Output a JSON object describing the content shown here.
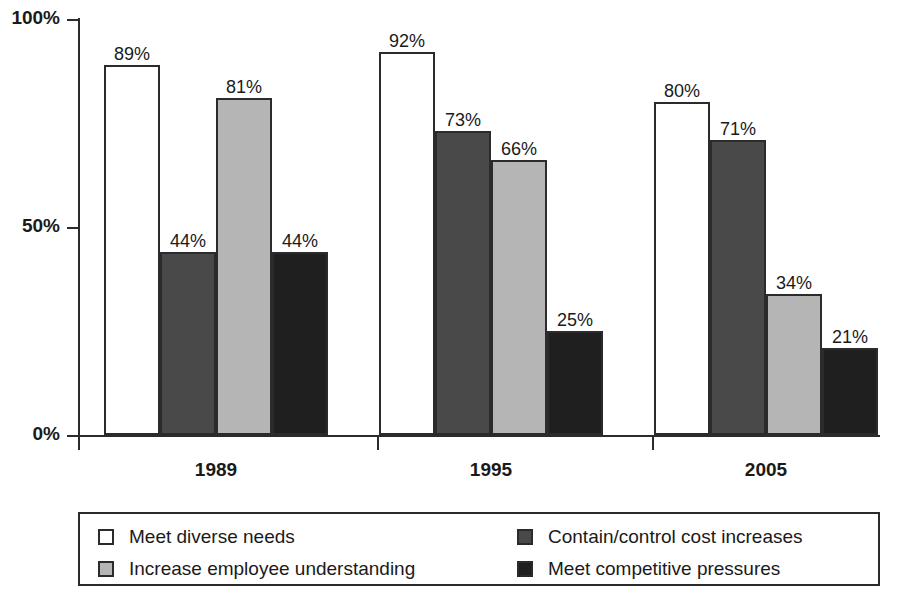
{
  "chart_data": {
    "type": "bar",
    "title": "",
    "subtitle": "",
    "xlabel": "",
    "ylabel": "",
    "categories": [
      "1989",
      "1995",
      "2005"
    ],
    "series": [
      {
        "name": "Meet diverse needs",
        "color": "#ffffff",
        "values": [
          89,
          92,
          80
        ],
        "labels": [
          "89%",
          "92%",
          "80%"
        ]
      },
      {
        "name": "Contain/control cost increases",
        "color": "#494949",
        "values": [
          44,
          73,
          71
        ],
        "labels": [
          "44%",
          "73%",
          "71%"
        ]
      },
      {
        "name": "Increase employee understanding",
        "color": "#b5b5b5",
        "values": [
          81,
          66,
          34
        ],
        "labels": [
          "81%",
          "66%",
          "34%"
        ]
      },
      {
        "name": "Meet competitive pressures",
        "color": "#1f1f1f",
        "values": [
          44,
          25,
          21
        ],
        "labels": [
          "44%",
          "25%",
          "21%"
        ]
      }
    ],
    "ylim": [
      0,
      100
    ],
    "yticks": [
      0,
      50,
      100
    ],
    "ytick_labels": [
      "0%",
      "50%",
      "100%"
    ],
    "grid": false,
    "legend_position": "bottom",
    "axis_color": "#2b2b2b"
  },
  "legend": {
    "entries": [
      {
        "label": "Meet diverse needs",
        "color": "#ffffff"
      },
      {
        "label": "Contain/control cost increases",
        "color": "#494949"
      },
      {
        "label": "Increase employee understanding",
        "color": "#b5b5b5"
      },
      {
        "label": "Meet competitive pressures",
        "color": "#1f1f1f"
      }
    ]
  }
}
